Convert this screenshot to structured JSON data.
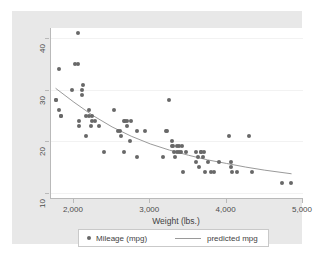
{
  "chart_data": {
    "type": "scatter",
    "title": "",
    "xlabel": "Weight (lbs.)",
    "ylabel": "",
    "xlim": [
      1700,
      5000
    ],
    "ylim": [
      9,
      42
    ],
    "xticks": [
      2000,
      3000,
      4000,
      5000
    ],
    "xtick_labels": [
      "2,000",
      "3,000",
      "4,000",
      "5,000"
    ],
    "yticks": [
      10,
      20,
      30,
      40
    ],
    "ytick_labels": [
      "10",
      "20",
      "30",
      "40"
    ],
    "grid": "horizontal-faint",
    "legend_position": "below-axis",
    "marker_color": "#686868",
    "line_color": "#9a9a9a",
    "series": [
      {
        "name": "Mileage (mpg)",
        "type": "scatter",
        "points": [
          [
            1760,
            28
          ],
          [
            1760,
            28
          ],
          [
            1800,
            34
          ],
          [
            1800,
            26
          ],
          [
            1830,
            25
          ],
          [
            1830,
            25
          ],
          [
            1980,
            30
          ],
          [
            2020,
            35
          ],
          [
            2050,
            35
          ],
          [
            2050,
            41
          ],
          [
            2070,
            24
          ],
          [
            2070,
            23
          ],
          [
            2100,
            29
          ],
          [
            2110,
            30
          ],
          [
            2120,
            31
          ],
          [
            2160,
            21
          ],
          [
            2160,
            25
          ],
          [
            2200,
            25
          ],
          [
            2200,
            26
          ],
          [
            2230,
            23
          ],
          [
            2240,
            25
          ],
          [
            2240,
            24
          ],
          [
            2280,
            24
          ],
          [
            2330,
            23
          ],
          [
            2400,
            18
          ],
          [
            2520,
            26
          ],
          [
            2580,
            22
          ],
          [
            2600,
            22
          ],
          [
            2620,
            21
          ],
          [
            2650,
            18
          ],
          [
            2650,
            24
          ],
          [
            2670,
            24
          ],
          [
            2690,
            24
          ],
          [
            2700,
            23
          ],
          [
            2730,
            20
          ],
          [
            2750,
            24
          ],
          [
            2830,
            17
          ],
          [
            2830,
            22
          ],
          [
            2930,
            22
          ],
          [
            3170,
            17
          ],
          [
            3200,
            22
          ],
          [
            3220,
            22
          ],
          [
            3250,
            28
          ],
          [
            3280,
            19
          ],
          [
            3280,
            20
          ],
          [
            3300,
            19
          ],
          [
            3310,
            18
          ],
          [
            3330,
            17
          ],
          [
            3350,
            19
          ],
          [
            3350,
            18
          ],
          [
            3370,
            19
          ],
          [
            3380,
            18
          ],
          [
            3400,
            18
          ],
          [
            3420,
            19
          ],
          [
            3430,
            14
          ],
          [
            3470,
            18
          ],
          [
            3600,
            16
          ],
          [
            3600,
            18
          ],
          [
            3620,
            17
          ],
          [
            3640,
            15
          ],
          [
            3670,
            18
          ],
          [
            3670,
            18
          ],
          [
            3690,
            17
          ],
          [
            3700,
            18
          ],
          [
            3720,
            14
          ],
          [
            3750,
            16
          ],
          [
            3790,
            14
          ],
          [
            3830,
            14
          ],
          [
            3900,
            16
          ],
          [
            4030,
            21
          ],
          [
            4060,
            16
          ],
          [
            4060,
            15
          ],
          [
            4070,
            14
          ],
          [
            4130,
            14
          ],
          [
            4290,
            21
          ],
          [
            4330,
            14
          ],
          [
            4720,
            12
          ],
          [
            4840,
            12
          ]
        ]
      },
      {
        "name": "predicted mpg",
        "type": "line",
        "points": [
          [
            1760,
            30.3
          ],
          [
            2000,
            27.6
          ],
          [
            2250,
            25.0
          ],
          [
            2500,
            22.8
          ],
          [
            2750,
            21.0
          ],
          [
            3000,
            19.5
          ],
          [
            3250,
            18.3
          ],
          [
            3500,
            17.3
          ],
          [
            3750,
            16.4
          ],
          [
            4000,
            15.7
          ],
          [
            4250,
            15.0
          ],
          [
            4500,
            14.4
          ],
          [
            4850,
            13.7
          ]
        ]
      }
    ],
    "legend": [
      {
        "label": "Mileage (mpg)",
        "swatch": "marker"
      },
      {
        "label": "predicted mpg",
        "swatch": "line"
      }
    ]
  }
}
